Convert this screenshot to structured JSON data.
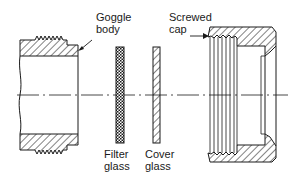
{
  "diagram": {
    "type": "exploded cross-section",
    "labels": {
      "goggle_body": [
        "Goggle",
        "body"
      ],
      "screwed_cap": [
        "Screwed",
        "cap"
      ],
      "filter_glass": [
        "Filter",
        "glass"
      ],
      "cover_glass": [
        "Cover",
        "glass"
      ]
    },
    "parts": [
      "goggle-body",
      "filter-glass",
      "cover-glass",
      "screwed-cap"
    ],
    "colors": {
      "line": "#1a1a1a",
      "background": "#ffffff"
    }
  }
}
